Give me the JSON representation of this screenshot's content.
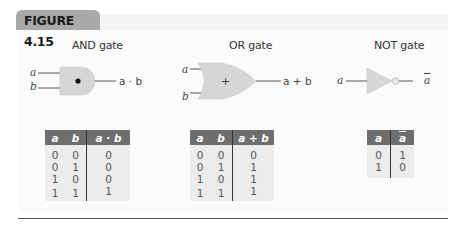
{
  "figure": {
    "label": "FIGURE 4.15"
  },
  "colors": {
    "gate_fill": "#d6d6d6",
    "header_bg": "#6e6e6e",
    "table_bg": "#ececec",
    "label_bg": "#a9a9a9"
  },
  "gates": [
    {
      "title": "AND gate",
      "inputs": [
        "a",
        "b"
      ],
      "symbol": "•",
      "output": "a · b",
      "table": {
        "headers": [
          "a",
          "b",
          "a · b"
        ],
        "rows": [
          [
            "0",
            "0",
            "0"
          ],
          [
            "0",
            "1",
            "0"
          ],
          [
            "1",
            "0",
            "0"
          ],
          [
            "1",
            "1",
            "1"
          ]
        ]
      }
    },
    {
      "title": "OR gate",
      "inputs": [
        "a",
        "b"
      ],
      "symbol": "+",
      "output": "a + b",
      "table": {
        "headers": [
          "a",
          "b",
          "a + b"
        ],
        "rows": [
          [
            "0",
            "0",
            "0"
          ],
          [
            "0",
            "1",
            "1"
          ],
          [
            "1",
            "0",
            "1"
          ],
          [
            "1",
            "1",
            "1"
          ]
        ]
      }
    },
    {
      "title": "NOT gate",
      "inputs": [
        "a"
      ],
      "output": "a",
      "table": {
        "headers": [
          "a",
          "a"
        ],
        "rows": [
          [
            "0",
            "1"
          ],
          [
            "1",
            "0"
          ]
        ]
      }
    }
  ]
}
